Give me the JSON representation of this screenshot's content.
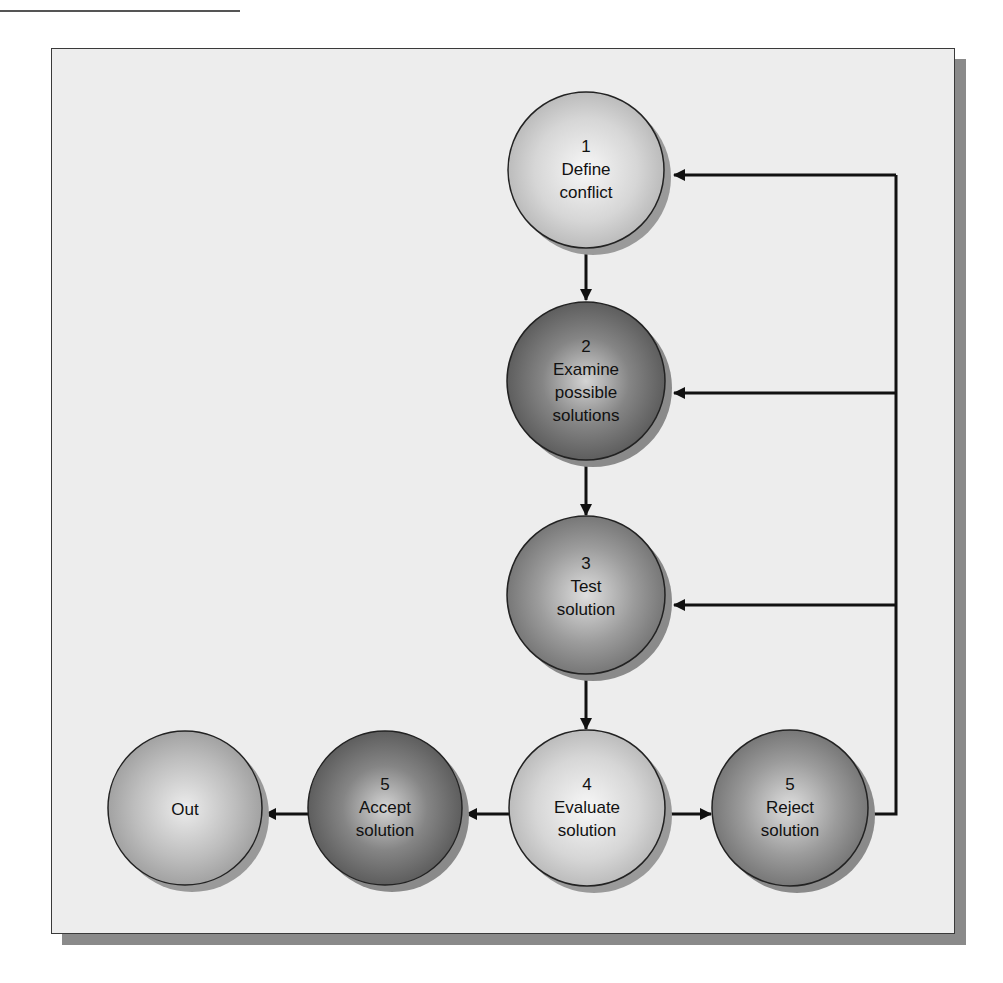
{
  "diagram": {
    "type": "flowchart",
    "title": "",
    "colors": {
      "frame_background": "#ededed",
      "frame_border": "#3a3a3a",
      "frame_shadow": "#8a8a8a",
      "line": "#111111",
      "node_light": "#cfcfcf",
      "node_medium": "#8e8e8e",
      "node_dark": "#6a6a6a"
    },
    "nodes": [
      {
        "id": "define",
        "number": "1",
        "lines": [
          "Define",
          "conflict"
        ],
        "shade": "light"
      },
      {
        "id": "examine",
        "number": "2",
        "lines": [
          "Examine",
          "possible",
          "solutions"
        ],
        "shade": "dark"
      },
      {
        "id": "test",
        "number": "3",
        "lines": [
          "Test",
          "solution"
        ],
        "shade": "medium"
      },
      {
        "id": "evaluate",
        "number": "4",
        "lines": [
          "Evaluate",
          "solution"
        ],
        "shade": "light"
      },
      {
        "id": "accept",
        "number": "5",
        "lines": [
          "Accept",
          "solution"
        ],
        "shade": "dark"
      },
      {
        "id": "reject",
        "number": "5",
        "lines": [
          "Reject",
          "solution"
        ],
        "shade": "medium"
      },
      {
        "id": "out",
        "number": "",
        "lines": [
          "Out"
        ],
        "shade": "light-medium"
      }
    ],
    "edges": [
      {
        "from": "define",
        "to": "examine"
      },
      {
        "from": "examine",
        "to": "test"
      },
      {
        "from": "test",
        "to": "evaluate"
      },
      {
        "from": "evaluate",
        "to": "accept"
      },
      {
        "from": "accept",
        "to": "out"
      },
      {
        "from": "evaluate",
        "to": "reject"
      },
      {
        "from": "reject",
        "to": "define",
        "label": "feedback"
      },
      {
        "from": "reject",
        "to": "examine",
        "label": "feedback"
      },
      {
        "from": "reject",
        "to": "test",
        "label": "feedback"
      }
    ]
  }
}
